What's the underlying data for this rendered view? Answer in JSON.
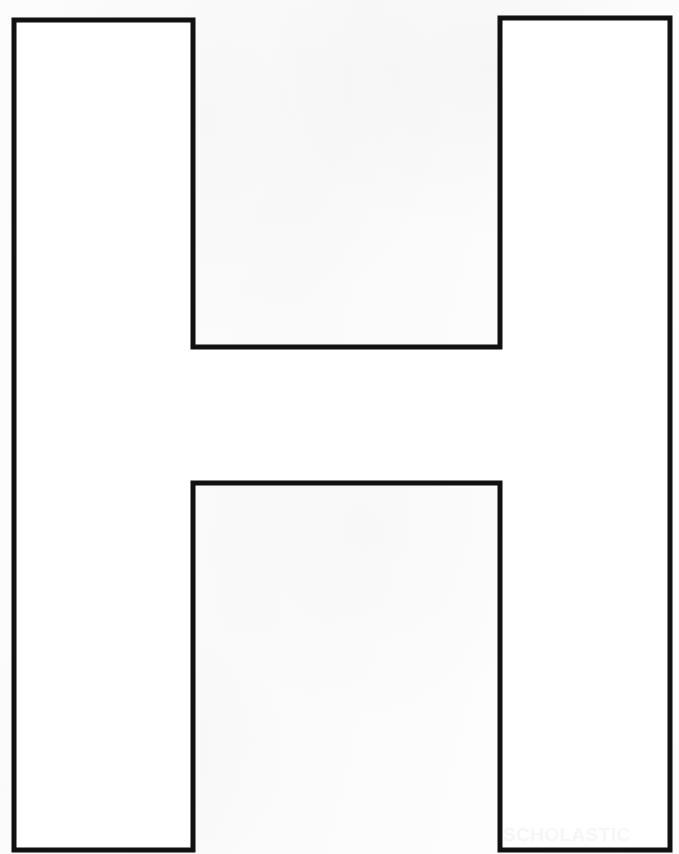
{
  "document": {
    "title": "Letter H Template",
    "page_width": 679,
    "page_height": 854,
    "background_color": "#fcfcfc",
    "stroke_color": "#111111",
    "fill_color": "#ffffff",
    "stroke_width": 5
  },
  "artwork": {
    "name": "uppercase-letter-h-outline",
    "letter": "H",
    "description": "Large uppercase block letter H outline, printable tracing template",
    "outline_points": "14,20 193,20 193,347 500,347 500,18 670,18 670,850 500,850 500,483 193,483 193,850 14,850",
    "geometry": {
      "outer_left_x": 14,
      "outer_right_x": 670,
      "left_stem_inner_x": 193,
      "right_stem_inner_x": 500,
      "left_stem_top_y": 20,
      "right_stem_top_y": 18,
      "bottom_y": 850,
      "crossbar_top_y": 347,
      "crossbar_bottom_y": 483,
      "left_stem_width": 179,
      "right_stem_width": 170,
      "crossbar_height": 136
    }
  },
  "watermark": {
    "text": "SCHOLASTIC",
    "color": "#787878",
    "opacity": "0.085"
  }
}
